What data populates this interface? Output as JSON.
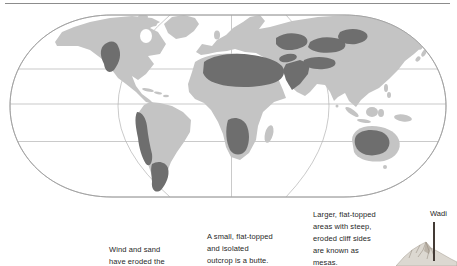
{
  "page": {
    "title_hidden": "",
    "figure_type": "world desert distribution map"
  },
  "map": {
    "semantic_name": "world-map-desert-regions",
    "gridlines": {
      "parallels": 3,
      "meridians": 3
    },
    "desert_region_names": [
      "north-american-desert",
      "atacama-desert",
      "patagonian-desert",
      "sahara-desert",
      "arabian-desert",
      "kalahari-namib-desert",
      "karakum-desert",
      "iranian-desert",
      "taklamakan-desert",
      "gobi-desert",
      "australian-desert"
    ]
  },
  "captions": {
    "erosion": {
      "text": "Wind and sand\nhave eroded the"
    },
    "butte": {
      "text": "A small, flat-topped\nand isolated\noutcrop is a butte."
    },
    "mesa": {
      "text": "Larger, flat-topped\nareas with steep,\neroded cliff sides\nare known as\nmesas."
    },
    "wadi_label": "Wadi"
  },
  "colors": {
    "background": "#ffffff",
    "land": "#c4c4c4",
    "desert": "#6e6e6e",
    "grid": "#b3b3b3",
    "map_outline": "#9e9e9e",
    "top_rule": "#8c8c8c",
    "text": "#1f1f1f",
    "leader_line": "#433a35",
    "mountain_light": "#dcd8d1",
    "mountain_shade": "#b5ada1"
  }
}
